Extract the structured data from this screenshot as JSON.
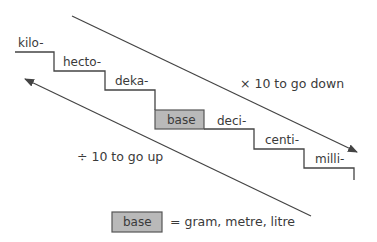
{
  "diagram": {
    "type": "metric-prefix-staircase",
    "steps": [
      {
        "label": "kilo-"
      },
      {
        "label": "hecto-"
      },
      {
        "label": "deka-"
      },
      {
        "label": "base"
      },
      {
        "label": "deci-"
      },
      {
        "label": "centi-"
      },
      {
        "label": "milli-"
      }
    ],
    "arrows": {
      "down": {
        "text": "× 10 to go down"
      },
      "up": {
        "text": "÷ 10 to go up"
      }
    },
    "legend": {
      "box_label": "base",
      "text": "= gram, metre, litre"
    },
    "colors": {
      "line": "#444444",
      "base_box_fill": "#b9b9b9",
      "text": "#3a3a3a"
    }
  }
}
